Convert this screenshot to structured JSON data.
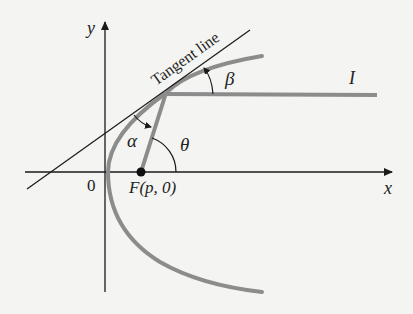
{
  "figure": {
    "type": "diagram",
    "colors": {
      "background": "#f4f4f2",
      "axis": "#1a1a1a",
      "curve": "#8c8c8c",
      "ray": "#8c8c8c",
      "tangent": "#1a1a1a",
      "text": "#222222"
    }
  },
  "axes": {
    "x_label": "x",
    "y_label": "y",
    "origin_label": "0"
  },
  "labels": {
    "tangent": "Tangent line",
    "focus": "F(p, 0)",
    "alpha": "α",
    "beta": "β",
    "theta": "θ",
    "incident_ray": "I"
  }
}
